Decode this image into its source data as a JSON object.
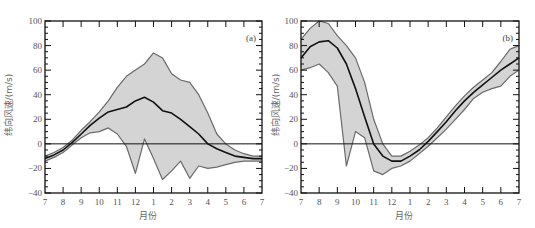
{
  "chart_data": [
    {
      "type": "area",
      "panel_label": "(a)",
      "xlabel": "月份",
      "ylabel": "纬向风速/(m/s)",
      "ylim": [
        -40,
        100
      ],
      "yticks": [
        -40,
        -20,
        0,
        20,
        40,
        60,
        80,
        100
      ],
      "ytick_labels": [
        "−40",
        "−20",
        "0",
        "20",
        "40",
        "60",
        "80",
        "100"
      ],
      "xtick_labels": [
        "7",
        "8",
        "9",
        "10",
        "11",
        "12",
        "1",
        "2",
        "3",
        "4",
        "5",
        "6",
        "7"
      ],
      "grid": false,
      "reference_line": 0,
      "x": [
        0,
        0.5,
        1,
        1.5,
        2,
        2.5,
        3,
        3.5,
        4,
        4.5,
        5,
        5.5,
        6,
        6.5,
        7,
        7.5,
        8,
        8.5,
        9,
        9.5,
        10,
        10.5,
        11,
        11.5,
        12
      ],
      "series": [
        {
          "name": "mean",
          "values": [
            -12,
            -9,
            -5,
            1,
            8,
            15,
            21,
            26,
            28,
            30,
            35,
            38,
            34,
            27,
            25,
            20,
            14,
            8,
            0,
            -4,
            -7,
            -10,
            -11,
            -12,
            -12
          ]
        },
        {
          "name": "max",
          "values": [
            -10,
            -7,
            -3,
            3,
            11,
            18,
            26,
            35,
            46,
            55,
            60,
            65,
            74,
            70,
            57,
            52,
            50,
            40,
            25,
            8,
            0,
            -5,
            -8,
            -10,
            -10
          ]
        },
        {
          "name": "min",
          "values": [
            -14,
            -11,
            -7,
            -1,
            5,
            9,
            10,
            13,
            8,
            -2,
            -24,
            4,
            -12,
            -29,
            -22,
            -14,
            -28,
            -18,
            -20,
            -19,
            -17,
            -15,
            -14,
            -14,
            -14
          ]
        }
      ]
    },
    {
      "type": "area",
      "panel_label": "(b)",
      "xlabel": "月份",
      "ylabel": "纬向风速/(m/s)",
      "ylim": [
        -40,
        100
      ],
      "yticks": [
        -40,
        -20,
        0,
        20,
        40,
        60,
        80,
        100
      ],
      "ytick_labels": [
        "−40",
        "−20",
        "0",
        "20",
        "40",
        "60",
        "80",
        "100"
      ],
      "xtick_labels": [
        "7",
        "8",
        "9",
        "10",
        "11",
        "12",
        "1",
        "2",
        "3",
        "4",
        "5",
        "6",
        "7"
      ],
      "grid": false,
      "reference_line": 0,
      "x": [
        0,
        0.5,
        1,
        1.5,
        2,
        2.5,
        3,
        3.5,
        4,
        4.5,
        5,
        5.5,
        6,
        6.5,
        7,
        7.5,
        8,
        8.5,
        9,
        9.5,
        10,
        10.5,
        11,
        11.5,
        12
      ],
      "series": [
        {
          "name": "mean",
          "values": [
            70,
            79,
            83,
            84,
            78,
            65,
            45,
            22,
            0,
            -10,
            -14,
            -14,
            -10,
            -5,
            2,
            10,
            18,
            27,
            35,
            42,
            48,
            54,
            60,
            65,
            70
          ]
        },
        {
          "name": "max",
          "values": [
            85,
            94,
            100,
            98,
            88,
            80,
            70,
            50,
            20,
            0,
            -10,
            -10,
            -6,
            -1,
            5,
            13,
            22,
            31,
            39,
            46,
            52,
            58,
            67,
            77,
            80
          ]
        },
        {
          "name": "min",
          "values": [
            60,
            62,
            65,
            58,
            47,
            -18,
            10,
            5,
            -22,
            -25,
            -20,
            -18,
            -14,
            -8,
            -2,
            5,
            12,
            20,
            28,
            37,
            42,
            45,
            47,
            55,
            60
          ]
        }
      ]
    }
  ]
}
